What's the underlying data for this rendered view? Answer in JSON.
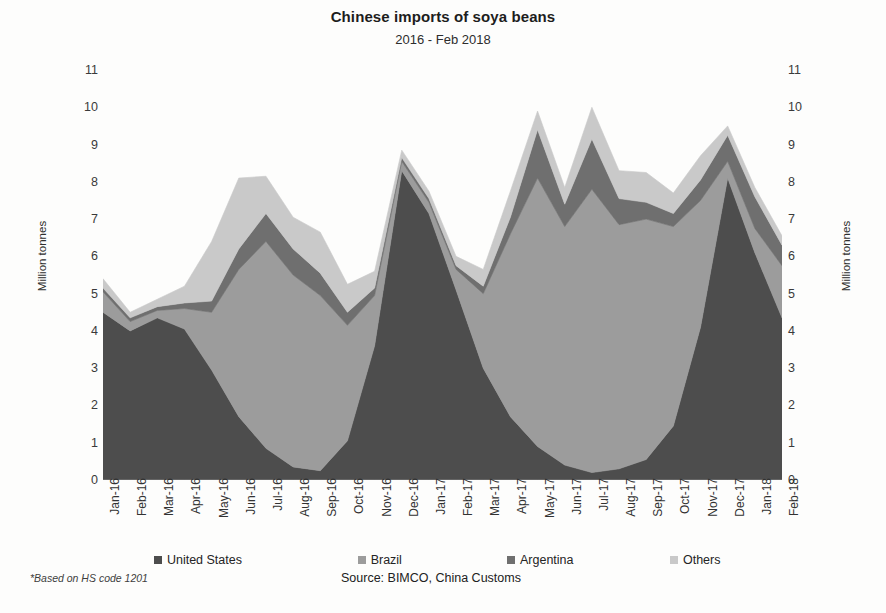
{
  "header": {
    "title": "Chinese imports of soya beans",
    "subtitle": "2016 - Feb 2018"
  },
  "footer": {
    "footnote": "*Based on HS code 1201",
    "source": "Source: BIMCO, China Customs"
  },
  "axes": {
    "y_left_title": "Million tonnes",
    "y_right_title": "Million tonnes"
  },
  "chart_data": {
    "type": "area",
    "stacked": true,
    "title": "Chinese imports of soya beans",
    "subtitle": "2016 - Feb 2018",
    "xlabel": "",
    "ylabel": "Million tonnes",
    "ylim": [
      0,
      11
    ],
    "ytick_labels": [
      "0",
      "1",
      "2",
      "3",
      "4",
      "5",
      "6",
      "7",
      "8",
      "9",
      "10",
      "11"
    ],
    "ytick_values": [
      0,
      1,
      2,
      3,
      4,
      5,
      6,
      7,
      8,
      9,
      10,
      11
    ],
    "grid": false,
    "legend_position": "bottom",
    "dual_y_axis": true,
    "categories": [
      "Jan-16",
      "Feb-16",
      "Mar-16",
      "Apr-16",
      "May-16",
      "Jun-16",
      "Jul-16",
      "Aug-16",
      "Sep-16",
      "Oct-16",
      "Nov-16",
      "Dec-16",
      "Jan-17",
      "Feb-17",
      "Mar-17",
      "Apr-17",
      "May-17",
      "Jun-17",
      "Jul-17",
      "Aug-17",
      "Sep-17",
      "Oct-17",
      "Nov-17",
      "Dec-17",
      "Jan-18",
      "Feb-18"
    ],
    "series": [
      {
        "name": "United States",
        "color": "#4d4d4d",
        "values": [
          4.5,
          4.0,
          4.35,
          4.05,
          2.95,
          1.7,
          0.85,
          0.35,
          0.25,
          1.05,
          3.6,
          8.3,
          7.15,
          5.1,
          3.0,
          1.7,
          0.9,
          0.4,
          0.2,
          0.3,
          0.55,
          1.45,
          4.1,
          8.1,
          6.1,
          4.35
        ]
      },
      {
        "name": "Brazil",
        "color": "#9c9c9c",
        "values": [
          0.55,
          0.25,
          0.2,
          0.55,
          1.55,
          3.95,
          5.55,
          5.15,
          4.7,
          3.1,
          1.35,
          0.25,
          0.3,
          0.55,
          2.0,
          4.9,
          7.2,
          6.4,
          7.6,
          6.55,
          6.45,
          5.35,
          3.4,
          0.45,
          0.65,
          1.4
        ]
      },
      {
        "name": "Argentina",
        "color": "#6f6f6f",
        "values": [
          0.1,
          0.1,
          0.1,
          0.15,
          0.3,
          0.55,
          0.75,
          0.7,
          0.6,
          0.35,
          0.2,
          0.1,
          0.1,
          0.1,
          0.2,
          0.45,
          1.3,
          0.6,
          1.35,
          0.7,
          0.45,
          0.35,
          0.55,
          0.7,
          0.85,
          0.55
        ]
      },
      {
        "name": "Others",
        "color": "#c9c9c9",
        "values": [
          0.25,
          0.15,
          0.2,
          0.45,
          1.6,
          1.9,
          1.0,
          0.85,
          1.1,
          0.75,
          0.45,
          0.2,
          0.2,
          0.25,
          0.45,
          0.7,
          0.5,
          0.45,
          0.85,
          0.75,
          0.8,
          0.55,
          0.65,
          0.25,
          0.25,
          0.25
        ]
      }
    ],
    "totals": [
      5.4,
      4.5,
      4.85,
      5.2,
      6.4,
      8.1,
      8.15,
      7.05,
      6.65,
      5.25,
      5.6,
      8.85,
      7.75,
      6.0,
      5.65,
      7.75,
      9.9,
      7.85,
      10.0,
      8.3,
      8.25,
      7.7,
      8.7,
      9.5,
      7.85,
      6.55
    ]
  }
}
